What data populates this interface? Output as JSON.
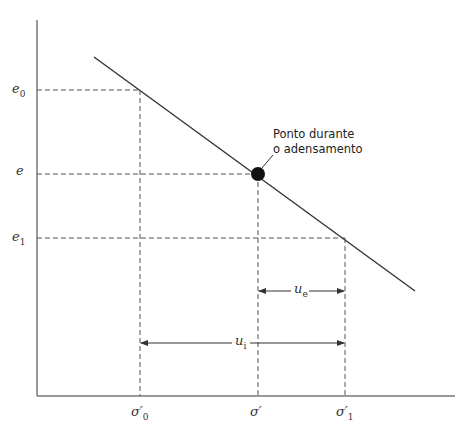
{
  "diagram": {
    "type": "void-ratio-vs-effective-stress",
    "y_labels": {
      "e0": {
        "base": "e",
        "sub": "0"
      },
      "e": {
        "base": "e",
        "sub": ""
      },
      "e1": {
        "base": "e",
        "sub": "1"
      }
    },
    "x_labels": {
      "sigma0": {
        "base": "σ′",
        "sub": "0"
      },
      "sigma": {
        "base": "σ′",
        "sub": ""
      },
      "sigma1": {
        "base": "σ′",
        "sub": "1"
      }
    },
    "annotation": {
      "line1": "Ponto durante",
      "line2": "o adensamento"
    },
    "dimensions": {
      "ue": {
        "base": "u",
        "sub": "e"
      },
      "ui": {
        "base": "u",
        "sub": "i"
      }
    },
    "colors": {
      "line": "#333333",
      "axis": "#666666",
      "dash": "#555555",
      "point": "#111111"
    }
  }
}
